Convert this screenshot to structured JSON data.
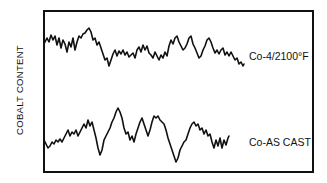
{
  "chart_data": {
    "type": "line",
    "title": "",
    "xlabel": "",
    "ylabel": "COBALT CONTENT",
    "grid": false,
    "legend": "inline labels at right end of each trace",
    "axis_ticks": "none",
    "frame": {
      "left": 44,
      "top": 11,
      "right": 313,
      "bottom": 172
    },
    "series": [
      {
        "name": "Co-4/2100°F",
        "label": "Co-4/2100°F",
        "description": "heat-treated trace, upper half of plot",
        "points": [
          [
            44,
            44
          ],
          [
            47,
            38
          ],
          [
            49,
            42
          ],
          [
            51,
            35
          ],
          [
            53,
            40
          ],
          [
            55,
            36
          ],
          [
            57,
            45
          ],
          [
            59,
            38
          ],
          [
            61,
            48
          ],
          [
            63,
            40
          ],
          [
            65,
            44
          ],
          [
            67,
            52
          ],
          [
            69,
            42
          ],
          [
            71,
            47
          ],
          [
            73,
            38
          ],
          [
            75,
            50
          ],
          [
            77,
            42
          ],
          [
            79,
            36
          ],
          [
            81,
            38
          ],
          [
            83,
            34
          ],
          [
            85,
            33
          ],
          [
            87,
            30
          ],
          [
            89,
            28
          ],
          [
            91,
            32
          ],
          [
            93,
            40
          ],
          [
            95,
            38
          ],
          [
            97,
            45
          ],
          [
            99,
            42
          ],
          [
            101,
            48
          ],
          [
            103,
            54
          ],
          [
            105,
            60
          ],
          [
            107,
            58
          ],
          [
            109,
            66
          ],
          [
            111,
            60
          ],
          [
            113,
            54
          ],
          [
            115,
            50
          ],
          [
            117,
            56
          ],
          [
            119,
            51
          ],
          [
            121,
            54
          ],
          [
            123,
            50
          ],
          [
            125,
            55
          ],
          [
            127,
            52
          ],
          [
            129,
            57
          ],
          [
            131,
            55
          ],
          [
            133,
            53
          ],
          [
            135,
            58
          ],
          [
            137,
            50
          ],
          [
            139,
            47
          ],
          [
            141,
            52
          ],
          [
            143,
            45
          ],
          [
            145,
            50
          ],
          [
            147,
            46
          ],
          [
            149,
            53
          ],
          [
            151,
            55
          ],
          [
            153,
            58
          ],
          [
            155,
            52
          ],
          [
            157,
            56
          ],
          [
            159,
            60
          ],
          [
            161,
            55
          ],
          [
            163,
            58
          ],
          [
            165,
            52
          ],
          [
            167,
            56
          ],
          [
            169,
            46
          ],
          [
            171,
            40
          ],
          [
            173,
            44
          ],
          [
            175,
            38
          ],
          [
            177,
            36
          ],
          [
            179,
            42
          ],
          [
            181,
            46
          ],
          [
            183,
            50
          ],
          [
            185,
            48
          ],
          [
            187,
            44
          ],
          [
            189,
            38
          ],
          [
            191,
            36
          ],
          [
            193,
            44
          ],
          [
            195,
            48
          ],
          [
            197,
            53
          ],
          [
            199,
            58
          ],
          [
            201,
            56
          ],
          [
            203,
            50
          ],
          [
            205,
            46
          ],
          [
            207,
            40
          ],
          [
            209,
            38
          ],
          [
            211,
            42
          ],
          [
            213,
            48
          ],
          [
            215,
            53
          ],
          [
            217,
            50
          ],
          [
            219,
            54
          ],
          [
            221,
            50
          ],
          [
            223,
            48
          ],
          [
            225,
            55
          ],
          [
            227,
            52
          ],
          [
            229,
            56
          ],
          [
            231,
            52
          ],
          [
            233,
            56
          ],
          [
            235,
            60
          ],
          [
            237,
            58
          ],
          [
            239,
            64
          ],
          [
            241,
            62
          ],
          [
            243,
            66
          ],
          [
            244,
            64
          ]
        ]
      },
      {
        "name": "Co-AS CAST",
        "label": "Co-AS CAST",
        "description": "as-cast trace, lower half of plot",
        "points": [
          [
            44,
            140
          ],
          [
            46,
            144
          ],
          [
            48,
            148
          ],
          [
            50,
            146
          ],
          [
            52,
            142
          ],
          [
            54,
            144
          ],
          [
            56,
            140
          ],
          [
            58,
            142
          ],
          [
            60,
            139
          ],
          [
            62,
            142
          ],
          [
            64,
            138
          ],
          [
            66,
            134
          ],
          [
            68,
            130
          ],
          [
            70,
            136
          ],
          [
            72,
            132
          ],
          [
            74,
            134
          ],
          [
            76,
            130
          ],
          [
            78,
            136
          ],
          [
            80,
            132
          ],
          [
            82,
            128
          ],
          [
            84,
            124
          ],
          [
            86,
            128
          ],
          [
            88,
            120
          ],
          [
            90,
            126
          ],
          [
            92,
            122
          ],
          [
            94,
            130
          ],
          [
            96,
            138
          ],
          [
            98,
            148
          ],
          [
            100,
            155
          ],
          [
            102,
            150
          ],
          [
            104,
            140
          ],
          [
            106,
            136
          ],
          [
            108,
            132
          ],
          [
            110,
            128
          ],
          [
            112,
            122
          ],
          [
            114,
            118
          ],
          [
            116,
            112
          ],
          [
            118,
            108
          ],
          [
            120,
            112
          ],
          [
            122,
            118
          ],
          [
            124,
            128
          ],
          [
            126,
            134
          ],
          [
            128,
            132
          ],
          [
            130,
            140
          ],
          [
            132,
            136
          ],
          [
            134,
            142
          ],
          [
            136,
            134
          ],
          [
            138,
            128
          ],
          [
            140,
            122
          ],
          [
            142,
            118
          ],
          [
            144,
            124
          ],
          [
            146,
            130
          ],
          [
            148,
            136
          ],
          [
            150,
            130
          ],
          [
            152,
            122
          ],
          [
            154,
            116
          ],
          [
            156,
            118
          ],
          [
            158,
            116
          ],
          [
            160,
            120
          ],
          [
            162,
            122
          ],
          [
            164,
            124
          ],
          [
            166,
            130
          ],
          [
            168,
            138
          ],
          [
            170,
            144
          ],
          [
            172,
            150
          ],
          [
            174,
            156
          ],
          [
            176,
            162
          ],
          [
            178,
            158
          ],
          [
            180,
            150
          ],
          [
            182,
            146
          ],
          [
            184,
            142
          ],
          [
            186,
            140
          ],
          [
            188,
            134
          ],
          [
            190,
            128
          ],
          [
            192,
            124
          ],
          [
            194,
            122
          ],
          [
            196,
            126
          ],
          [
            198,
            124
          ],
          [
            200,
            130
          ],
          [
            202,
            128
          ],
          [
            204,
            134
          ],
          [
            206,
            130
          ],
          [
            208,
            136
          ],
          [
            210,
            134
          ],
          [
            212,
            142
          ],
          [
            214,
            148
          ],
          [
            216,
            140
          ],
          [
            218,
            146
          ],
          [
            220,
            138
          ],
          [
            222,
            148
          ],
          [
            224,
            140
          ],
          [
            226,
            145
          ],
          [
            228,
            138
          ],
          [
            229,
            136
          ]
        ]
      }
    ],
    "annotations": [
      {
        "text": "Co-4/2100°F",
        "x": 249,
        "y": 60
      },
      {
        "text": "Co-AS CAST",
        "x": 249,
        "y": 146
      }
    ]
  }
}
